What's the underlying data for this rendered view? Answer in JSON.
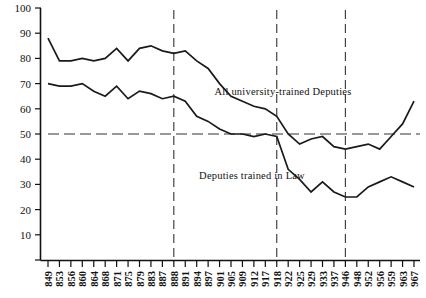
{
  "chart_data": {
    "type": "line",
    "title": "",
    "subtitle": "",
    "xlabel": "",
    "ylabel": "",
    "xlim": [
      1849,
      1967
    ],
    "ylim": [
      0,
      100
    ],
    "grid": false,
    "legend_position": "inline-annotations",
    "y_ticks": [
      0,
      10,
      20,
      30,
      40,
      50,
      60,
      70,
      80,
      90,
      100
    ],
    "y_tick_labels": [
      "",
      "10",
      "20",
      "30",
      "40",
      "50",
      "60",
      "70",
      "80",
      "90",
      "100"
    ],
    "x_tick_labels": [
      "849",
      "853",
      "856",
      "860",
      "864",
      "868",
      "871",
      "875",
      "879",
      "883",
      "887",
      "888",
      "891",
      "894",
      "897",
      "901",
      "905",
      "909",
      "912",
      "917",
      "918",
      "922",
      "925",
      "929",
      "933",
      "937",
      "946",
      "948",
      "952",
      "956",
      "959",
      "963",
      "967"
    ],
    "x": [
      1849,
      1853,
      1856,
      1860,
      1864,
      1868,
      1871,
      1875,
      1879,
      1883,
      1887,
      1888,
      1891,
      1894,
      1897,
      1901,
      1905,
      1909,
      1912,
      1917,
      1918,
      1922,
      1925,
      1929,
      1933,
      1937,
      1946,
      1948,
      1952,
      1956,
      1959,
      1963,
      1967
    ],
    "reference_lines": {
      "horizontal": [
        {
          "value": 50,
          "style": "dashed"
        }
      ],
      "vertical": [
        {
          "value": 1888,
          "style": "dashed"
        },
        {
          "value": 1918,
          "style": "dashed"
        },
        {
          "value": 1946,
          "style": "dashed"
        }
      ]
    },
    "series": [
      {
        "name": "All university-trained Deputies",
        "label": "All university-trained Deputies",
        "values": [
          88,
          79,
          79,
          80,
          79,
          80,
          84,
          79,
          84,
          85,
          83,
          82,
          83,
          79,
          76,
          70,
          65,
          63,
          61,
          60,
          57,
          50,
          46,
          48,
          49,
          45,
          44,
          45,
          46,
          44,
          49,
          54,
          63
        ]
      },
      {
        "name": "Deputies trained in Law",
        "label": "Deputies trained in Law",
        "values": [
          70,
          69,
          69,
          70,
          67,
          65,
          69,
          64,
          67,
          66,
          64,
          65,
          63,
          57,
          55,
          52,
          50,
          50,
          49,
          50,
          49,
          36,
          32,
          27,
          31,
          27,
          25,
          25,
          29,
          31,
          33,
          31,
          29
        ]
      }
    ],
    "annotations": [
      {
        "text": "All university-trained Deputies",
        "x_px": 283,
        "y_px": 95
      },
      {
        "text": "Deputies trained in Law",
        "x_px": 252,
        "y_px": 179
      }
    ]
  }
}
